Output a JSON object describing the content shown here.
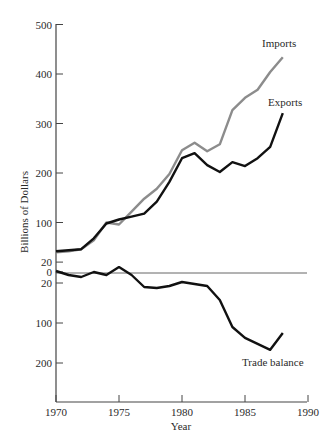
{
  "chart_data": {
    "type": "line",
    "title": "",
    "xlabel": "Year",
    "ylabel": "Billions of Dollars",
    "xlim": [
      1970,
      1990
    ],
    "x_ticks": [
      1970,
      1975,
      1980,
      1985,
      1990
    ],
    "y_ticks_upper": [
      500,
      400,
      300,
      200,
      100,
      20,
      0
    ],
    "y_ticks_lower": [
      20,
      100,
      200
    ],
    "y_tick_labels": [
      "500",
      "400",
      "300",
      "200",
      "100",
      "20",
      "0",
      "20",
      "100",
      "200"
    ],
    "grid": false,
    "legend": "inline labels",
    "x": [
      1970,
      1971,
      1972,
      1973,
      1974,
      1975,
      1976,
      1977,
      1978,
      1979,
      1980,
      1981,
      1982,
      1983,
      1984,
      1985,
      1986,
      1987,
      1988
    ],
    "series": [
      {
        "name": "Imports",
        "color": "#8c8c8c",
        "values": [
          40,
          42,
          46,
          64,
          100,
          96,
          122,
          148,
          168,
          198,
          246,
          261,
          244,
          258,
          327,
          352,
          368,
          404,
          434
        ]
      },
      {
        "name": "Exports",
        "color": "#111111",
        "values": [
          42,
          44,
          46,
          68,
          98,
          106,
          112,
          118,
          142,
          182,
          230,
          240,
          216,
          202,
          222,
          214,
          230,
          253,
          321
        ]
      },
      {
        "name": "Trade balance",
        "color": "#111111",
        "values": [
          2,
          -4,
          -8,
          0,
          -4,
          10,
          -4,
          -28,
          -30,
          -26,
          -18,
          -22,
          -26,
          -54,
          -110,
          -137,
          -152,
          -167,
          -125
        ]
      }
    ],
    "labels": {
      "imports": "Imports",
      "exports": "Exports",
      "trade_balance": "Trade balance"
    }
  }
}
